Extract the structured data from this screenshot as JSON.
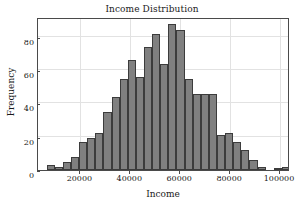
{
  "chart_data": {
    "type": "bar",
    "title": "Income Distribution",
    "xlabel": "Income",
    "ylabel": "Frequency",
    "xlim": [
      3000,
      104000
    ],
    "ylim": [
      0,
      92
    ],
    "grid": true,
    "legend": null,
    "bar_color": "#808080",
    "bar_edge_color": "#3c3c3c",
    "xticks": [
      20000,
      40000,
      60000,
      80000,
      100000
    ],
    "xtick_labels": [
      "20000",
      "40000",
      "60000",
      "80000",
      "100000"
    ],
    "yticks": [
      0,
      20,
      40,
      60,
      80
    ],
    "ytick_labels": [
      "0",
      "20",
      "40",
      "60",
      "80"
    ],
    "bin_width": 3250,
    "bin_starts": [
      6500,
      9750,
      13000,
      16250,
      19500,
      22750,
      26000,
      29250,
      32500,
      35750,
      39000,
      42250,
      45500,
      48750,
      52000,
      55250,
      58500,
      61750,
      65000,
      68250,
      71500,
      74750,
      78000,
      81250,
      84500,
      87750,
      91000,
      94250,
      97500,
      100750
    ],
    "categories": [
      "6500",
      "9750",
      "13000",
      "16250",
      "19500",
      "22750",
      "26000",
      "29250",
      "32500",
      "35750",
      "39000",
      "42250",
      "45500",
      "48750",
      "52000",
      "55250",
      "58500",
      "61750",
      "65000",
      "68250",
      "71500",
      "74750",
      "78000",
      "81250",
      "84500",
      "87750",
      "91000",
      "94250",
      "97500",
      "100750"
    ],
    "values": [
      3,
      2,
      5,
      8,
      17,
      19,
      22,
      35,
      44,
      55,
      66,
      56,
      74,
      82,
      64,
      88,
      84,
      55,
      46,
      46,
      46,
      21,
      22,
      17,
      12,
      6,
      2,
      0,
      1,
      2
    ]
  }
}
